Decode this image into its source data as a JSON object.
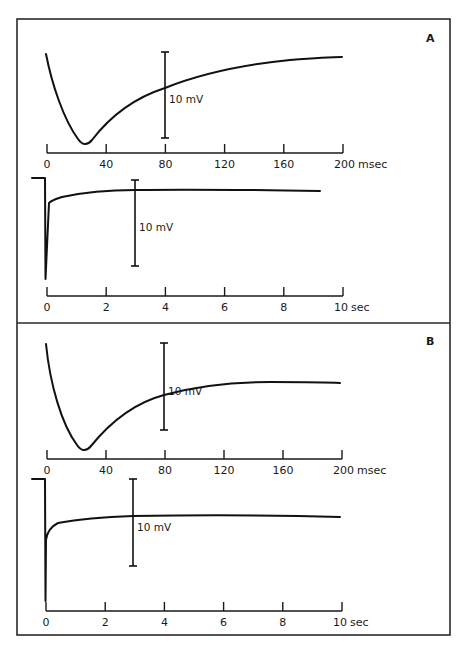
{
  "figure": {
    "panels": [
      {
        "label": "A",
        "label_pos": [
          426,
          42
        ],
        "box": {
          "y0": 19,
          "y1": 323
        },
        "traces": [
          {
            "id": "A-fast",
            "axis_y": 153,
            "x_px": [
              47,
              343
            ],
            "ticks": [
              "0",
              "40",
              "80",
              "120",
              "160",
              "200"
            ],
            "unit": "msec",
            "scale_bar": {
              "x": 165,
              "y_top": 52,
              "y_bottom": 138,
              "label": "10 mV"
            },
            "path": "M46,54 C52,85 64,120 78,139 C82,145 87,146 92,140 C115,110 140,96 165,88 C205,72 250,64 290,60 C315,58 330,57 342,57"
          },
          {
            "id": "A-slow",
            "axis_y": 296,
            "x_px": [
              47,
              343
            ],
            "ticks": [
              "0",
              "2",
              "4",
              "6",
              "8",
              "10"
            ],
            "unit": "sec",
            "scale_bar": {
              "x": 135,
              "y_top": 180,
              "y_bottom": 266,
              "label": "10 mV"
            },
            "path": "M32,178 L45,178 L45.5,279 L49,203 C52,200 56,199 62,197 C85,192 110,190 135,190 C200,189 260,190 320,191"
          }
        ]
      },
      {
        "label": "B",
        "label_pos": [
          426,
          345
        ],
        "box": {
          "y0": 323,
          "y1": 635
        },
        "traces": [
          {
            "id": "B-fast",
            "axis_y": 459,
            "x_px": [
              47,
              342
            ],
            "ticks": [
              "0",
              "40",
              "80",
              "120",
              "160",
              "200"
            ],
            "unit": "msec",
            "scale_bar": {
              "x": 164,
              "y_top": 343,
              "y_bottom": 430,
              "label": "10 mV"
            },
            "path": "M46,344 C50,385 62,425 77,445 C81,451 86,452 91,446 C112,420 138,402 164,395 C200,385 235,382 270,382 C300,382 325,382 340,383"
          },
          {
            "id": "B-slow",
            "axis_y": 611,
            "x_px": [
              46,
              342
            ],
            "ticks": [
              "0",
              "2",
              "4",
              "6",
              "8",
              "10"
            ],
            "unit": "sec",
            "scale_bar": {
              "x": 133,
              "y_top": 479,
              "y_bottom": 566,
              "label": "10 mV"
            },
            "path": "M32,479 L45,479 L45.5,601 L46,540 C47,532 50,527 58,523 C80,519 105,517 133,516 C200,515 270,515 340,517"
          }
        ]
      }
    ]
  },
  "chart_data": [
    {
      "type": "line",
      "title": "A (fast time base)",
      "xlabel": "msec",
      "ylabel": "membrane potential (scale bar 10 mV)",
      "x_ticks": [
        0,
        40,
        80,
        120,
        160,
        200
      ],
      "xlim": [
        0,
        200
      ],
      "series": [
        {
          "name": "A",
          "x": [
            0,
            10,
            20,
            26,
            40,
            60,
            80,
            120,
            160,
            200
          ],
          "y_mV_rel": [
            0,
            -11,
            -19,
            -21,
            -16,
            -11,
            -8,
            -4,
            -1,
            -0.5
          ]
        }
      ],
      "scale_bar": "10 mV"
    },
    {
      "type": "line",
      "title": "A (slow time base)",
      "xlabel": "sec",
      "x_ticks": [
        0,
        2,
        4,
        6,
        8,
        10
      ],
      "xlim": [
        0,
        10
      ],
      "series": [
        {
          "name": "A",
          "x": [
            -0.5,
            0,
            0.02,
            0.1,
            0.5,
            1,
            2,
            3,
            6,
            9.2
          ],
          "y_mV_rel": [
            0,
            0,
            -11.8,
            -2.8,
            -2.2,
            -1.8,
            -1.4,
            -1.4,
            -1.4,
            -1.5
          ]
        }
      ],
      "scale_bar": "10 mV"
    },
    {
      "type": "line",
      "title": "B (fast time base)",
      "xlabel": "msec",
      "x_ticks": [
        0,
        40,
        80,
        120,
        160,
        200
      ],
      "xlim": [
        0,
        200
      ],
      "series": [
        {
          "name": "B",
          "x": [
            0,
            10,
            20,
            26,
            40,
            60,
            80,
            120,
            160,
            200
          ],
          "y_mV_rel": [
            0,
            -11,
            -19,
            -21,
            -16,
            -11,
            -6,
            -4.4,
            -4.4,
            -4.5
          ]
        }
      ],
      "scale_bar": "10 mV"
    },
    {
      "type": "line",
      "title": "B (slow time base)",
      "xlabel": "sec",
      "x_ticks": [
        0,
        2,
        4,
        6,
        8,
        10
      ],
      "xlim": [
        0,
        10
      ],
      "series": [
        {
          "name": "B",
          "x": [
            -0.5,
            0,
            0.02,
            0.1,
            0.5,
            1,
            2,
            3,
            6,
            10
          ],
          "y_mV_rel": [
            0,
            0,
            -14,
            -6.9,
            -5.1,
            -4.6,
            -4.3,
            -4.3,
            -4.2,
            -4.4
          ]
        }
      ],
      "scale_bar": "10 mV"
    }
  ]
}
